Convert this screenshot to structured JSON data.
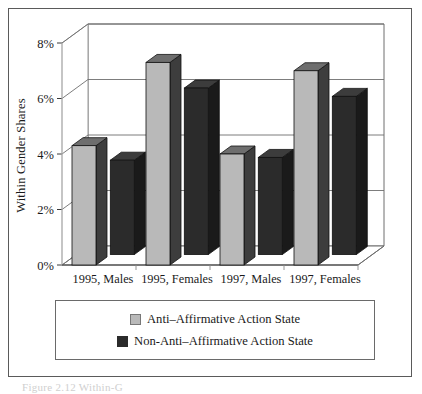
{
  "figure": {
    "caption_partial": "Figure 2.12   Within-G"
  },
  "legend": {
    "position": "below-axis",
    "items": [
      {
        "label": "Anti–Affirmative Action State",
        "color": "#b9b9b9",
        "swatch": "light-gray-square"
      },
      {
        "label": "Non-Anti–Affirmative Action State",
        "color": "#2b2b2b",
        "swatch": "dark-square"
      }
    ]
  },
  "chart_data": {
    "type": "bar",
    "title": "",
    "xlabel": "",
    "ylabel": "Within Gender Shares",
    "categories": [
      "1995, Males",
      "1995, Females",
      "1997, Males",
      "1997, Females"
    ],
    "ylim": [
      0,
      8
    ],
    "yticks": [
      0,
      2,
      4,
      6,
      8
    ],
    "ytick_labels": [
      "0%",
      "2%",
      "4%",
      "6%",
      "8%"
    ],
    "grid": true,
    "style": "3d-columns",
    "legend_position": "bottom",
    "series": [
      {
        "name": "Anti–Affirmative Action State",
        "color": "#b9b9b9",
        "values": [
          4.3,
          7.3,
          4.0,
          7.0
        ]
      },
      {
        "name": "Non-Anti–Affirmative Action State",
        "color": "#2b2b2b",
        "values": [
          3.4,
          6.0,
          3.5,
          5.7
        ]
      }
    ]
  }
}
